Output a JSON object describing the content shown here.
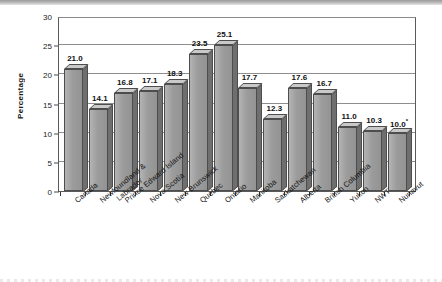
{
  "chart_data": {
    "type": "bar",
    "title": "",
    "subtitle": "",
    "xlabel": "",
    "ylabel": "Percentage",
    "ylim": [
      0,
      30
    ],
    "yticks": [
      0,
      5,
      10,
      15,
      20,
      25,
      30
    ],
    "grid": true,
    "legend": null,
    "orientation": "vertical",
    "style": "3d-column",
    "categories": [
      "Canada",
      "Newfoundland & Labrador",
      "Prince Edward Island",
      "Nova Scotia",
      "New Brunswick",
      "Quebec",
      "Ontario",
      "Manitoba",
      "Saskatchewan",
      "Alberta",
      "British Columbia",
      "Yukon",
      "NWT",
      "Nunavut"
    ],
    "values": [
      21.0,
      14.1,
      16.8,
      17.1,
      18.3,
      23.5,
      25.1,
      17.7,
      12.3,
      17.6,
      16.7,
      11.0,
      10.3,
      10.0
    ],
    "data_labels": [
      "21.0",
      "14.1",
      "16.8",
      "17.1",
      "18.3",
      "23.5",
      "25.1",
      "17.7",
      "12.3",
      "17.6",
      "16.7",
      "11.0",
      "10.3",
      "10.0"
    ],
    "annotations": [
      {
        "category": "Nunavut",
        "marker": "*",
        "value_label": "10.0*"
      }
    ],
    "colors": {
      "bar_front": "#a0a0a0",
      "bar_side": "#6f6f6f",
      "bar_top": "#c9c9c9",
      "bar_outline": "#4d4d4d",
      "gridline": "#8e8e8e",
      "axis": "#5a5a5a",
      "text": "#111111",
      "background": "#ffffff"
    }
  },
  "category_label_lines": [
    [
      "Canada",
      ""
    ],
    [
      "Newfoundland &",
      "Labrador"
    ],
    [
      "Prince Edward Island",
      ""
    ],
    [
      "Nova Scotia",
      ""
    ],
    [
      "New Brunswick",
      ""
    ],
    [
      "Quebec",
      ""
    ],
    [
      "Ontario",
      ""
    ],
    [
      "Manitoba",
      ""
    ],
    [
      "Saskatchewan",
      ""
    ],
    [
      "Alberta",
      ""
    ],
    [
      "British Columbia",
      ""
    ],
    [
      "Yukon",
      ""
    ],
    [
      "NWT",
      ""
    ],
    [
      "Nunavut",
      ""
    ]
  ]
}
